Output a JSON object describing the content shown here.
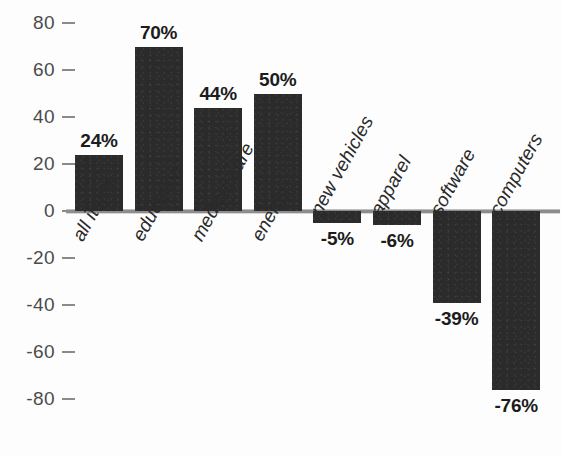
{
  "chart_data": {
    "type": "bar",
    "title": "",
    "subtitle": "",
    "xlabel": "",
    "ylabel": "",
    "ylim": [
      -90,
      88
    ],
    "yticks": [
      80,
      60,
      40,
      20,
      0,
      -20,
      -40,
      -60,
      -80
    ],
    "ytick_labels": [
      "80",
      "60",
      "40",
      "20",
      "0",
      "-20",
      "-40",
      "-60",
      "-80"
    ],
    "grid": false,
    "legend": null,
    "zero_line": true,
    "categories": [
      "all items",
      "education",
      "medical care",
      "energy",
      "new vehicles",
      "apparel",
      "software",
      "computers"
    ],
    "values": [
      24,
      70,
      44,
      50,
      -5,
      -6,
      -39,
      -76
    ],
    "data_labels": [
      "24%",
      "70%",
      "44%",
      "50%",
      "-5%",
      "-6%",
      "-39%",
      "-76%"
    ],
    "series": [
      {
        "name": "percent change",
        "values": [
          24,
          70,
          44,
          50,
          -5,
          -6,
          -39,
          -76
        ]
      }
    ],
    "colors": {
      "bar": "#2b2b2b",
      "axis_line": "#8d8d8d",
      "tick": "#8a8a8a",
      "tick_label": "#4b4b4b",
      "data_label": "#1c1c1c",
      "category_label": "#2a2a2a",
      "background": "#fdfdfd"
    }
  }
}
